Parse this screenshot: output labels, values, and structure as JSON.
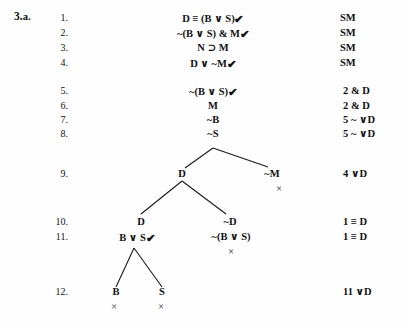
{
  "exercise": {
    "number": "3.",
    "letter": "a."
  },
  "symbols": {
    "check": "✔",
    "close": "×"
  },
  "proof_lines": [
    {
      "number": "1.",
      "formula": "D ≡ (B ∨ S)",
      "checked": true,
      "justification": "SM"
    },
    {
      "number": "2.",
      "formula": "~(B ∨ S) &  M",
      "checked": true,
      "justification": "SM"
    },
    {
      "number": "3.",
      "formula": "N ⊃ M",
      "checked": false,
      "justification": "SM"
    },
    {
      "number": "4.",
      "formula": "D ∨ ~M",
      "checked": true,
      "justification": "SM"
    },
    {
      "number": "5.",
      "formula": "~(B ∨ S)",
      "checked": true,
      "justification": "2 & D"
    },
    {
      "number": "6.",
      "formula": "M",
      "checked": false,
      "justification": "2 & D"
    },
    {
      "number": "7.",
      "formula": "~B",
      "checked": false,
      "justification": "5  ~ ∨D"
    },
    {
      "number": "8.",
      "formula": "~S",
      "checked": false,
      "justification": "5  ~ ∨D"
    },
    {
      "number": "9.",
      "formula": "",
      "checked": false,
      "justification": "4 ∨D"
    },
    {
      "number": "10.",
      "formula": "",
      "checked": false,
      "justification": "1  ≡ D"
    },
    {
      "number": "11.",
      "formula": "",
      "checked": false,
      "justification": "1  ≡ D"
    },
    {
      "number": "12.",
      "formula": "",
      "checked": false,
      "justification": "11 ∨D"
    }
  ],
  "tree_nodes": [
    {
      "id": "n9a",
      "label": "D",
      "checked": false,
      "closed": false
    },
    {
      "id": "n9b",
      "label": "~M",
      "checked": false,
      "closed": true
    },
    {
      "id": "n10a",
      "label": "D",
      "checked": false,
      "closed": false
    },
    {
      "id": "n10b",
      "label": "~D",
      "checked": false,
      "closed": false
    },
    {
      "id": "n11a",
      "label": "B ∨ S",
      "checked": true,
      "closed": false
    },
    {
      "id": "n11b",
      "label": "~(B ∨ S)",
      "checked": false,
      "closed": true
    },
    {
      "id": "n12a",
      "label": "B",
      "checked": false,
      "closed": true
    },
    {
      "id": "n12b",
      "label": "S",
      "checked": false,
      "closed": true
    }
  ],
  "colors": {
    "ink": "#111111",
    "background": "#fefefe",
    "branch_line": "#1a1a1a"
  }
}
